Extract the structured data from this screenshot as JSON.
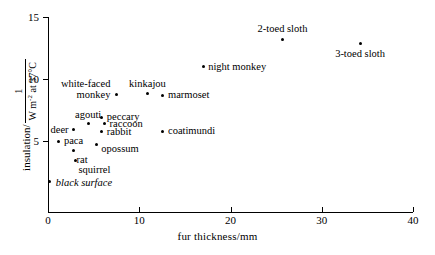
{
  "chart_data": {
    "type": "scatter",
    "title": "",
    "xlabel": "fur thickness/mm",
    "ylabel_prefix": "insulation/",
    "ylabel_fraction_numerator": "1",
    "ylabel_fraction_denominator": "W m",
    "ylabel_fraction_denominator_exponent": "-2",
    "ylabel_fraction_denominator_suffix": " at 37°C",
    "ylabel_full": "insulation/ 1 ⁄ (W m⁻² at 37°C)",
    "xlim": [
      0,
      40
    ],
    "ylim": [
      0,
      15
    ],
    "xticks": [
      "0",
      "10",
      "20",
      "30",
      "40"
    ],
    "xtick_values": [
      0,
      10,
      20,
      30,
      40
    ],
    "yticks": [
      "5",
      "10",
      "15"
    ],
    "ytick_values": [
      5,
      10,
      15
    ],
    "grid": false,
    "legend": null,
    "marker": "filled-circle",
    "marker_color": "#000000",
    "points": [
      {
        "label": "black surface",
        "x": 0.2,
        "y": 1.7,
        "italic": true,
        "lx": 6,
        "ly": -5,
        "align": "left"
      },
      {
        "label": "squirrel",
        "x": 3.0,
        "y": 3.4,
        "italic": false,
        "lx": 3,
        "ly": 3,
        "align": "left"
      },
      {
        "label": "rat",
        "x": 2.8,
        "y": 4.2,
        "italic": false,
        "lx": 3,
        "ly": 3,
        "align": "left"
      },
      {
        "label": "paca",
        "x": 1.2,
        "y": 5.0,
        "italic": false,
        "lx": 5,
        "ly": -6,
        "align": "left"
      },
      {
        "label": "opossum",
        "x": 5.3,
        "y": 4.75,
        "italic": false,
        "lx": 5,
        "ly": -1,
        "align": "left"
      },
      {
        "label": "deer",
        "x": 2.8,
        "y": 5.9,
        "italic": false,
        "lx": -5,
        "ly": -6,
        "align": "right"
      },
      {
        "label": "rabbit",
        "x": 5.9,
        "y": 5.75,
        "italic": false,
        "lx": 5,
        "ly": -6,
        "align": "left"
      },
      {
        "label": "agouti",
        "x": 4.4,
        "y": 6.4,
        "italic": false,
        "lx": 0,
        "ly": -15,
        "align": "center"
      },
      {
        "label": "raccoon",
        "x": 6.2,
        "y": 6.4,
        "italic": false,
        "lx": 5,
        "ly": -6,
        "align": "left"
      },
      {
        "label": "peccary",
        "x": 5.9,
        "y": 6.9,
        "italic": false,
        "lx": 5,
        "ly": -6,
        "align": "left"
      },
      {
        "label": "coatimundi",
        "x": 12.6,
        "y": 5.8,
        "italic": false,
        "lx": 5,
        "ly": -6,
        "align": "left"
      },
      {
        "label": "white-faced\nmonkey",
        "x": 7.5,
        "y": 8.75,
        "italic": false,
        "lx": -6,
        "ly": -17,
        "align": "right"
      },
      {
        "label": "kinkajou",
        "x": 10.9,
        "y": 8.8,
        "italic": false,
        "lx": 0,
        "ly": -16,
        "align": "center"
      },
      {
        "label": "marmoset",
        "x": 12.6,
        "y": 8.7,
        "italic": false,
        "lx": 5,
        "ly": -6,
        "align": "left"
      },
      {
        "label": "night monkey",
        "x": 17.0,
        "y": 11.0,
        "italic": false,
        "lx": 5,
        "ly": -6,
        "align": "left"
      },
      {
        "label": "2-toed sloth",
        "x": 25.7,
        "y": 13.2,
        "italic": false,
        "lx": 0,
        "ly": -16,
        "align": "center"
      },
      {
        "label": "3-toed sloth",
        "x": 34.2,
        "y": 12.9,
        "italic": false,
        "lx": 0,
        "ly": 5,
        "align": "center"
      }
    ]
  },
  "axes_geometry": {
    "x_origin_px": 48,
    "x_end_px": 413,
    "y_top_px": 17,
    "y_baseline_px": 212,
    "y_value_at_top": 15,
    "y_px_per_unit": 12.4,
    "x_px_per_unit": 9.125
  }
}
